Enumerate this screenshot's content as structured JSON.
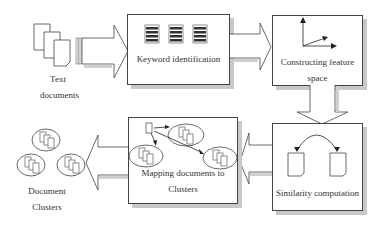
{
  "diagram": {
    "nodes": {
      "text_documents": {
        "label_line1": "Text",
        "label_line2": "documents"
      },
      "keyword_identification": {
        "label": "Keyword identification"
      },
      "constructing_feature_space": {
        "label_line1": "Constructing feature",
        "label_line2": "space"
      },
      "similarity_computation": {
        "label": "Similarity computation"
      },
      "mapping_documents": {
        "label_line1": "Mapping documents to",
        "label_line2": "Clusters"
      },
      "document_clusters": {
        "label_line1": "Document",
        "label_line2": "Clusters"
      }
    },
    "edges": [
      {
        "from": "text_documents",
        "to": "keyword_identification",
        "direction": "right"
      },
      {
        "from": "keyword_identification",
        "to": "constructing_feature_space",
        "direction": "right"
      },
      {
        "from": "constructing_feature_space",
        "to": "similarity_computation",
        "direction": "down"
      },
      {
        "from": "similarity_computation",
        "to": "mapping_documents",
        "direction": "left"
      },
      {
        "from": "mapping_documents",
        "to": "document_clusters",
        "direction": "left"
      }
    ],
    "colors": {
      "stroke": "#444444",
      "shadow": "#c8c8c8",
      "doc_fill": "#ffffff",
      "stack_fill": "#333333"
    }
  }
}
